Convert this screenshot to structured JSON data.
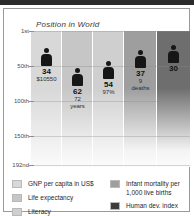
{
  "chart_data": {
    "type": "bar",
    "title": "Position in World",
    "xlabel": "",
    "ylabel": "Position in World",
    "ylim": [
      1,
      192
    ],
    "y_ticks": [
      "1st",
      "50th",
      "100th",
      "150th",
      "192nd"
    ],
    "y_tick_values": [
      1,
      50,
      100,
      150,
      192
    ],
    "grid": true,
    "legend_position": "bottom",
    "categories": [
      "GNP per capita in US$",
      "Life expectancy",
      "Literacy",
      "Infant mortality per 1,000 live births",
      "Human dev. index"
    ],
    "values": [
      34,
      62,
      54,
      37,
      30
    ],
    "value_labels": [
      "34",
      "62",
      "54",
      "37",
      "30"
    ],
    "annotations": [
      "$10550",
      "72 years",
      "97%",
      "9 deaths",
      ""
    ],
    "series": [
      {
        "name": "Position in World",
        "values": [
          34,
          62,
          54,
          37,
          30
        ]
      }
    ],
    "columns": [
      {
        "key": "gnp",
        "rank": "34",
        "detail_line1": "$10550",
        "detail_line2": "",
        "band_color": "#d8d8d8"
      },
      {
        "key": "life-expectancy",
        "rank": "62",
        "detail_line1": "72",
        "detail_line2": "years",
        "band_color": "#c6c6c6"
      },
      {
        "key": "literacy",
        "rank": "54",
        "detail_line1": "97%",
        "detail_line2": "",
        "band_color": "#cfcfcf"
      },
      {
        "key": "infant-mortality",
        "rank": "37",
        "detail_line1": "9",
        "detail_line2": "deaths",
        "band_color": "#9e9e9e"
      },
      {
        "key": "human-dev-index",
        "rank": "30",
        "detail_line1": "",
        "detail_line2": "",
        "band_color": "#6e6e6e"
      }
    ]
  },
  "axis": {
    "tick_1": "1st",
    "tick_2": "50th",
    "tick_3": "100th",
    "tick_4": "150th",
    "tick_5": "192nd"
  },
  "legend": {
    "left": [
      {
        "label": "GNP per capita in US$",
        "color": "#d8d8d8"
      },
      {
        "label": "Life expectancy",
        "color": "#c6c6c6"
      },
      {
        "label": "Literacy",
        "color": "#cfcfcf"
      }
    ],
    "right": [
      {
        "label": "Infant mortality per\n1,000 live births",
        "color": "#9e9e9e"
      },
      {
        "label": "Human dev. index",
        "color": "#3c3c3c"
      }
    ]
  }
}
